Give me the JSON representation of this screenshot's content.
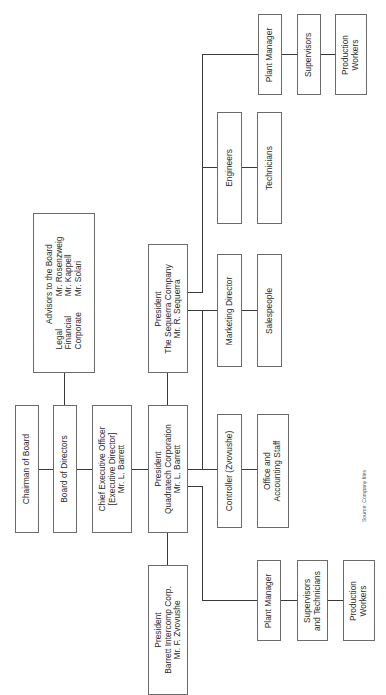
{
  "nodes": {
    "chairman": {
      "lines": [
        "Chairman of Board"
      ]
    },
    "board": {
      "lines": [
        "Board of Directors"
      ]
    },
    "advisors": {
      "title": "Advisors to the Board",
      "rows": [
        {
          "role": "Legal",
          "name": "Mr. Rosenzweig"
        },
        {
          "role": "Financial",
          "name": "Mr. Kappell"
        },
        {
          "role": "Corporate",
          "name": "Mr. Solari"
        }
      ]
    },
    "ceo": {
      "lines": [
        "Chief Executive Officer",
        "[Executive Director]",
        "Mr. L. Barrett"
      ]
    },
    "quadratech_president": {
      "lines": [
        "President",
        "Quadratech Corporation",
        "Mr. L. Barrett"
      ]
    },
    "sequerra_president": {
      "lines": [
        "President",
        "The Sequerra Company",
        "Mr. R. Sequerra"
      ]
    },
    "barrett_president": {
      "lines": [
        "President",
        "Barrett Intercomp Corp.",
        "Mr. F. Zvovushe"
      ]
    },
    "top_plant_manager": {
      "lines": [
        "Plant Manager"
      ]
    },
    "top_supervisors": {
      "lines": [
        "Supervisors"
      ]
    },
    "top_production_workers": {
      "lines": [
        "Production",
        "Workers"
      ]
    },
    "engineers": {
      "lines": [
        "Engineers"
      ]
    },
    "technicians": {
      "lines": [
        "Technicians"
      ]
    },
    "marketing_director": {
      "lines": [
        "Marketing Director"
      ]
    },
    "salespeople": {
      "lines": [
        "Salespeople"
      ]
    },
    "controller": {
      "lines": [
        "Controller (Zvovushe)"
      ]
    },
    "office_staff": {
      "lines": [
        "Office and",
        "Accounting Staff"
      ]
    },
    "bottom_plant_manager": {
      "lines": [
        "Plant Manager"
      ]
    },
    "bottom_supervisors": {
      "lines": [
        "Supervisors",
        "and Technicians"
      ]
    },
    "bottom_production_workers": {
      "lines": [
        "Production",
        "Workers"
      ]
    }
  },
  "source": "Source: Company files"
}
